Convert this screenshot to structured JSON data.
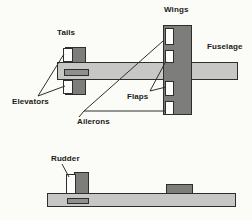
{
  "diagram": {
    "labels": {
      "tails": "Tails",
      "wings": "Wings",
      "fuselage": "Fuselage",
      "elevators": "Elevators",
      "flaps": "Flaps",
      "ailerons": "Ailerons",
      "rudder": "Rudder"
    },
    "colors": {
      "background": "#fbfbf8",
      "fuselage_fill": "#c7c7c5",
      "surface_fill": "#7d7d7b",
      "control_fill": "#fdfdfd",
      "window_fill": "#8f8f8d",
      "outline": "#2e2e2c",
      "label_color": "#1c1c1a"
    }
  }
}
